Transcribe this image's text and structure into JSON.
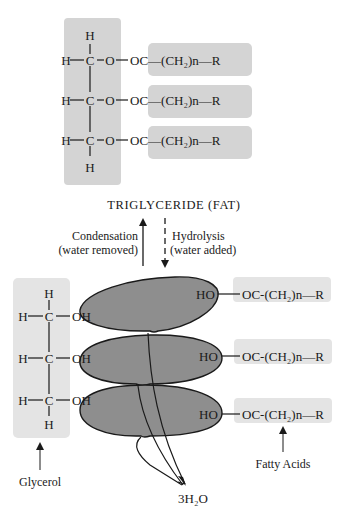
{
  "diagram": {
    "title": "TRIGLYCERIDE (FAT)",
    "triglyceride": {
      "glycerol_backbone": {
        "top_h": "H",
        "bottom_h": "H",
        "rows": [
          {
            "left": "H",
            "carbon": "C",
            "oxygen": "O"
          },
          {
            "left": "H",
            "carbon": "C",
            "oxygen": "O"
          },
          {
            "left": "H",
            "carbon": "C",
            "oxygen": "O"
          }
        ]
      },
      "ester_chains": [
        {
          "label": "OC—(CH₂)n—R"
        },
        {
          "label": "OC—(CH₂)n—R"
        },
        {
          "label": "OC—(CH₂)n—R"
        }
      ]
    },
    "reactions": {
      "condensation": {
        "line1": "Condensation",
        "line2": "(water removed)"
      },
      "hydrolysis": {
        "line1": "Hydrolysis",
        "line2": "(water added)"
      }
    },
    "glycerol": {
      "label": "Glycerol",
      "top_h": "H",
      "bottom_h": "H",
      "rows": [
        {
          "left": "H",
          "carbon": "C",
          "oh": "OH"
        },
        {
          "left": "H",
          "carbon": "C",
          "oh": "OH"
        },
        {
          "left": "H",
          "carbon": "C",
          "oh": "OH"
        }
      ]
    },
    "fatty_acids": {
      "label": "Fatty Acids",
      "rows": [
        {
          "ho": "HO",
          "chain": "OC-(CH₂)n—R"
        },
        {
          "ho": "HO",
          "chain": "OC-(CH₂)n—R"
        },
        {
          "ho": "HO",
          "chain": "OC-(CH₂)n—R"
        }
      ]
    },
    "water_product": "3H₂O",
    "colors": {
      "top_box": "#d4d4d4",
      "glycerol_box": "#e4e4e4",
      "fatty_acid_box": "#e4e4e4",
      "ellipse_fill": "#8e8e8e",
      "line": "#1a1a1a"
    }
  }
}
